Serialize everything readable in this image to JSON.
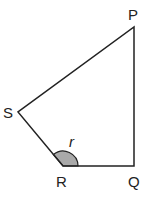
{
  "diagram": {
    "type": "quadrilateral",
    "vertices": [
      {
        "name": "P",
        "x": 134,
        "y": 27,
        "label_x": 128,
        "label_y": 20
      },
      {
        "name": "Q",
        "x": 134,
        "y": 166,
        "label_x": 128,
        "label_y": 187
      },
      {
        "name": "R",
        "x": 63,
        "y": 166,
        "label_x": 57,
        "label_y": 187
      },
      {
        "name": "S",
        "x": 18,
        "y": 112,
        "label_x": 4,
        "label_y": 118
      }
    ],
    "angle": {
      "vertex": "R",
      "label": "r",
      "label_x": 69,
      "label_y": 146,
      "fill": "#a9a9a9"
    },
    "stroke_color": "#222222"
  }
}
